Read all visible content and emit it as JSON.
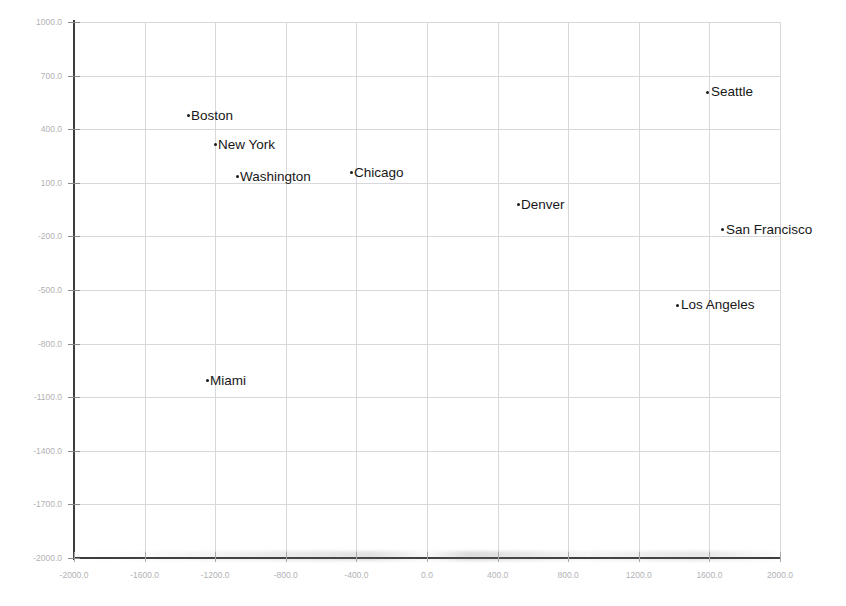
{
  "chart_data": {
    "type": "scatter",
    "title": "",
    "xlabel": "",
    "ylabel": "",
    "xlim": [
      -2000.0,
      2000.0
    ],
    "ylim": [
      -2000.0,
      1000.0
    ],
    "grid": true,
    "legend": "none",
    "x_ticks": [
      "-2000.0",
      "-1600.0",
      "-1200.0",
      "-800.0",
      "-400.0",
      "0.0",
      "400.0",
      "800.0",
      "1200.0",
      "1600.0",
      "2000.0"
    ],
    "x_tick_values": [
      -2000.0,
      -1600.0,
      -1200.0,
      -800.0,
      -400.0,
      0.0,
      400.0,
      800.0,
      1200.0,
      1600.0,
      2000.0
    ],
    "y_ticks": [
      "1000.0",
      "700.0",
      "400.0",
      "100.0",
      "-200.0",
      "-500.0",
      "-800.0",
      "-1100.0",
      "-1400.0",
      "-1700.0",
      "-2000.0"
    ],
    "y_tick_values": [
      1000.0,
      700.0,
      400.0,
      100.0,
      -200.0,
      -500.0,
      -800.0,
      -1100.0,
      -1400.0,
      -1700.0,
      -2000.0
    ],
    "point_color": "#1a1a1a",
    "grid_color": "#d8d8dc",
    "axis_color": "#3c3c3c",
    "tick_label_color": "#b2b2b6",
    "points": [
      {
        "label": "Boston",
        "x": -1354,
        "y": 474
      },
      {
        "label": "New York",
        "x": -1201,
        "y": 312
      },
      {
        "label": "Washington",
        "x": -1076,
        "y": 133
      },
      {
        "label": "Chicago",
        "x": -430,
        "y": 155
      },
      {
        "label": "Denver",
        "x": 516,
        "y": -24
      },
      {
        "label": "Seattle",
        "x": 1592,
        "y": 608
      },
      {
        "label": "San Francisco",
        "x": 1677,
        "y": -164
      },
      {
        "label": "Los Angeles",
        "x": 1422,
        "y": -584
      },
      {
        "label": "Miami",
        "x": -1246,
        "y": -1009
      }
    ]
  }
}
